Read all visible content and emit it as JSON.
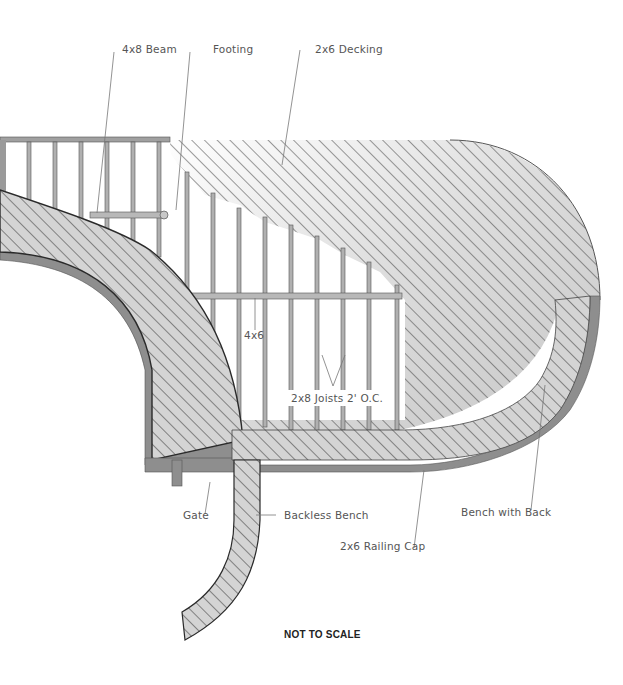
{
  "diagram": {
    "note": "NOT TO SCALE",
    "colors": {
      "background": "#ffffff",
      "framing": "#9a9a9a",
      "framing_stroke": "#555555",
      "decking_fill": "#d8d8d8",
      "hatch": "#3a3a3a",
      "railing_cap": "#8e8e8e",
      "label_text": "#555555"
    },
    "labels": {
      "beam": "4x8 Beam",
      "footing": "Footing",
      "decking": "2x6 Decking",
      "post_beam": "4x6",
      "joists": "2x8 Joists 2' O.C.",
      "gate": "Gate",
      "backless_bench": "Backless Bench",
      "railing_cap": "2x6 Railing Cap",
      "bench_with_back": "Bench with Back"
    }
  }
}
